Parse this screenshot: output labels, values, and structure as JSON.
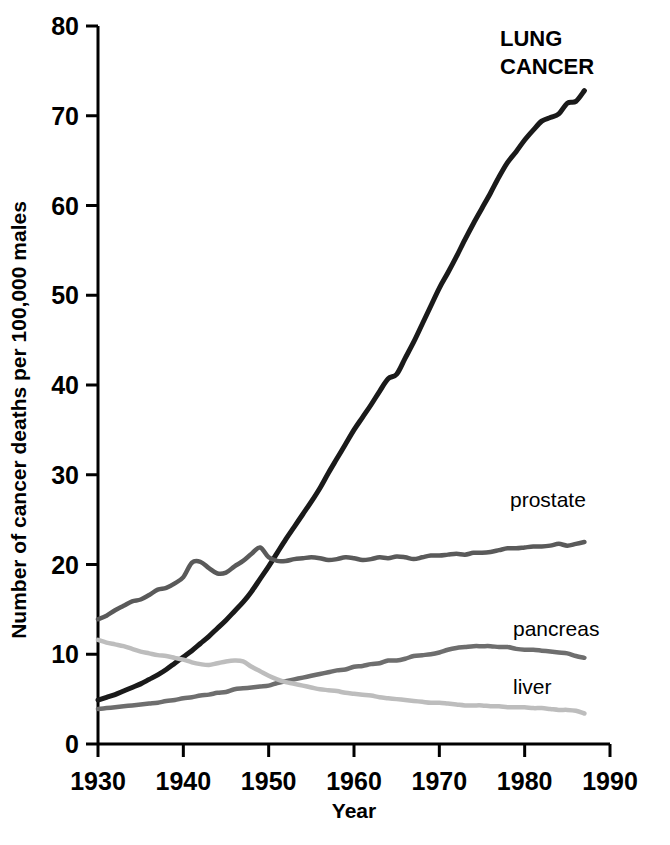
{
  "chart_data": {
    "type": "line",
    "title": "",
    "xlabel": "Year",
    "ylabel": "Number of cancer deaths per 100,000 males",
    "xlim": [
      1930,
      1990
    ],
    "ylim": [
      0,
      80
    ],
    "xticks": [
      "1930",
      "1940",
      "1950",
      "1960",
      "1970",
      "1980",
      "1990"
    ],
    "yticks": [
      "0",
      "10",
      "20",
      "30",
      "40",
      "50",
      "60",
      "70",
      "80"
    ],
    "grid": false,
    "legend_position": "inline-right-of-series",
    "x": [
      1930,
      1931,
      1932,
      1933,
      1934,
      1935,
      1936,
      1937,
      1938,
      1939,
      1940,
      1941,
      1942,
      1943,
      1944,
      1945,
      1946,
      1947,
      1948,
      1949,
      1950,
      1951,
      1952,
      1953,
      1954,
      1955,
      1956,
      1957,
      1958,
      1959,
      1960,
      1961,
      1962,
      1963,
      1964,
      1965,
      1966,
      1967,
      1968,
      1969,
      1970,
      1971,
      1972,
      1973,
      1974,
      1975,
      1976,
      1977,
      1978,
      1979,
      1980,
      1981,
      1982,
      1983,
      1984,
      1985,
      1986,
      1987
    ],
    "series": [
      {
        "name": "LUNG CANCER",
        "label": "LUNG CANCER",
        "color": "#1a1a1a",
        "label_style": "bold",
        "values": [
          4.9,
          5.2,
          5.5,
          5.9,
          6.3,
          6.7,
          7.2,
          7.7,
          8.3,
          9.0,
          9.7,
          10.4,
          11.2,
          12.0,
          12.9,
          13.8,
          14.8,
          15.8,
          17.0,
          18.4,
          19.8,
          21.3,
          22.8,
          24.2,
          25.6,
          27.0,
          28.5,
          30.2,
          31.8,
          33.4,
          35.0,
          36.4,
          37.8,
          39.3,
          40.7,
          41.2,
          43.0,
          44.8,
          46.8,
          48.8,
          50.8,
          52.5,
          54.3,
          56.2,
          58.0,
          59.7,
          61.4,
          63.2,
          64.8,
          66.0,
          67.3,
          68.4,
          69.4,
          69.8,
          70.2,
          71.4,
          71.6,
          72.8
        ]
      },
      {
        "name": "prostate",
        "label": "prostate",
        "color": "#5a5a5a",
        "label_style": "regular",
        "values": [
          13.9,
          14.3,
          14.9,
          15.4,
          15.9,
          16.1,
          16.6,
          17.2,
          17.4,
          17.9,
          18.6,
          20.2,
          20.3,
          19.6,
          19.0,
          19.1,
          19.8,
          20.4,
          21.2,
          21.9,
          20.8,
          20.4,
          20.4,
          20.6,
          20.7,
          20.8,
          20.7,
          20.5,
          20.6,
          20.8,
          20.7,
          20.5,
          20.6,
          20.8,
          20.7,
          20.9,
          20.8,
          20.6,
          20.8,
          21.0,
          21.0,
          21.1,
          21.2,
          21.1,
          21.3,
          21.3,
          21.4,
          21.6,
          21.8,
          21.8,
          21.9,
          22.0,
          22.0,
          22.1,
          22.3,
          22.1,
          22.3,
          22.5
        ]
      },
      {
        "name": "pancreas",
        "label": "pancreas",
        "color": "#6e6e6e",
        "label_style": "regular",
        "values": [
          3.9,
          4.0,
          4.1,
          4.2,
          4.3,
          4.4,
          4.5,
          4.6,
          4.8,
          4.9,
          5.1,
          5.2,
          5.4,
          5.5,
          5.7,
          5.8,
          6.1,
          6.2,
          6.3,
          6.4,
          6.5,
          6.8,
          7.0,
          7.2,
          7.4,
          7.6,
          7.8,
          8.0,
          8.2,
          8.3,
          8.6,
          8.7,
          8.9,
          9.0,
          9.3,
          9.3,
          9.5,
          9.8,
          9.9,
          10.0,
          10.2,
          10.5,
          10.7,
          10.8,
          10.9,
          10.9,
          10.9,
          10.8,
          10.8,
          10.6,
          10.5,
          10.5,
          10.4,
          10.3,
          10.2,
          10.1,
          9.8,
          9.6
        ]
      },
      {
        "name": "liver",
        "label": "liver",
        "color": "#bdbdbd",
        "label_style": "regular",
        "values": [
          11.6,
          11.3,
          11.1,
          10.9,
          10.6,
          10.3,
          10.1,
          9.9,
          9.8,
          9.6,
          9.4,
          9.1,
          8.9,
          8.8,
          9.0,
          9.2,
          9.3,
          9.2,
          8.6,
          8.1,
          7.6,
          7.2,
          6.9,
          6.7,
          6.5,
          6.3,
          6.1,
          6.0,
          5.9,
          5.7,
          5.6,
          5.5,
          5.4,
          5.2,
          5.1,
          5.0,
          4.9,
          4.8,
          4.7,
          4.6,
          4.6,
          4.5,
          4.4,
          4.3,
          4.3,
          4.3,
          4.2,
          4.2,
          4.1,
          4.1,
          4.1,
          4.0,
          4.0,
          3.9,
          3.8,
          3.8,
          3.7,
          3.4
        ]
      }
    ],
    "annotations": [
      {
        "text": "LUNG CANCER",
        "line1": "LUNG",
        "line2": "CANCER"
      },
      {
        "text": "prostate"
      },
      {
        "text": "pancreas"
      },
      {
        "text": "liver"
      }
    ]
  }
}
